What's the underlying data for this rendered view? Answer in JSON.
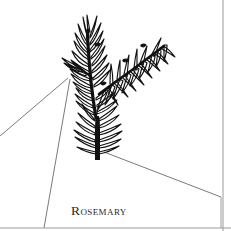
{
  "figure": {
    "kind": "botanical-line-illustration",
    "subject_label": "Rosemary",
    "caption": "Rosemary",
    "background_color": "#ffffff",
    "ink_color": "#111111",
    "leader_line_color": "#6b6b6b",
    "border_color": "#9a9a9a",
    "caption_color": "#2a2a2a"
  },
  "illustration": {
    "name": "rosemary-sprig",
    "description": "Upright rosemary sprig with a thick dark main stem, one side branch angling to the upper right, and whorls of narrow needle-like leaves along every stem",
    "stem": {
      "base_x": 98,
      "base_y": 160,
      "top_x": 88,
      "top_y": 30,
      "base_width": 6
    },
    "branch": {
      "origin_x": 101,
      "origin_y": 86,
      "tip_x": 166,
      "tip_y": 44
    }
  },
  "annotations": {
    "leader_lines": [
      {
        "name": "leader-line-left-upper",
        "from_x": 68,
        "from_y": 78,
        "to_x": 0,
        "to_y": 136
      },
      {
        "name": "leader-line-left-lower",
        "from_x": 70,
        "from_y": 79,
        "to_x": 44,
        "to_y": 228
      },
      {
        "name": "leader-line-right",
        "from_x": 104,
        "from_y": 152,
        "to_x": 221,
        "to_y": 197
      }
    ]
  },
  "borders": {
    "right_rule_x": 223,
    "bottom_rule_y": 228,
    "right_drop_x": 221,
    "right_drop_from_y": 197,
    "right_drop_to_y": 228
  }
}
